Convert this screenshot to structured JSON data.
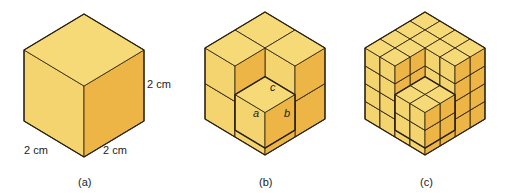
{
  "figure": {
    "panels": [
      {
        "id": "a",
        "caption": "(a)",
        "subdivisions": 1,
        "dimension_labels": {
          "height": "2 cm",
          "left_width": "2 cm",
          "right_width": "2 cm"
        }
      },
      {
        "id": "b",
        "caption": "(b)",
        "subdivisions": 2,
        "extracted_cube_face_labels": {
          "left": "a",
          "right": "b",
          "top": "c"
        }
      },
      {
        "id": "c",
        "caption": "(c)",
        "subdivisions": 4
      }
    ],
    "colors": {
      "top": "#F6DA78",
      "left": "#F4D46E",
      "right": "#EDB546",
      "shadow": "#E8A93A",
      "edge": "#2a2010"
    }
  }
}
